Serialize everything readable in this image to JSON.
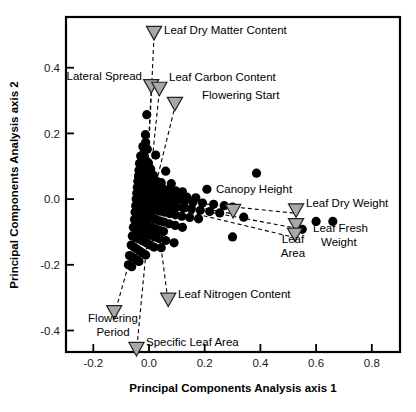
{
  "figure": {
    "kind": "pca-biplot",
    "background_color": "#ffffff",
    "foreground_color": "#000000",
    "marker_color": "#000000",
    "vector_marker_color": "#a8a8a8"
  },
  "axes": {
    "xlabel": "Principal Components Analysis axis 1",
    "ylabel": "Principal Components Analysis axis 2",
    "x_ticks": [
      "-0.2",
      "0.0",
      "0.2",
      "0.4",
      "0.6",
      "0.8"
    ],
    "y_ticks": [
      "0.4",
      "0.2",
      "0.0",
      "-0.2",
      "-0.4"
    ]
  },
  "chart_data": {
    "type": "scatter",
    "title": "",
    "xlabel": "Principal Components Analysis axis 1",
    "ylabel": "Principal Components Analysis axis 2",
    "xlim": [
      -0.29,
      0.9
    ],
    "ylim": [
      -0.5,
      0.61
    ],
    "xticks": [
      -0.2,
      0.0,
      0.2,
      0.4,
      0.6,
      0.8
    ],
    "yticks": [
      -0.4,
      -0.2,
      0.0,
      0.2,
      0.4
    ],
    "grid": false,
    "legend": "none",
    "series": [
      {
        "name": "species scores",
        "marker": "filled-circle",
        "color": "#000000",
        "points": [
          [
            -0.008,
            0.257
          ],
          [
            -0.013,
            0.196
          ],
          [
            -0.012,
            0.173
          ],
          [
            -0.022,
            0.16
          ],
          [
            -0.006,
            0.152
          ],
          [
            0.024,
            0.134
          ],
          [
            -0.018,
            0.142
          ],
          [
            -0.03,
            0.131
          ],
          [
            -0.026,
            0.12
          ],
          [
            -0.012,
            0.118
          ],
          [
            -0.002,
            0.11
          ],
          [
            -0.034,
            0.108
          ],
          [
            -0.02,
            0.1
          ],
          [
            -0.008,
            0.096
          ],
          [
            0.006,
            0.092
          ],
          [
            0.06,
            0.085
          ],
          [
            -0.036,
            0.088
          ],
          [
            -0.024,
            0.082
          ],
          [
            -0.01,
            0.079
          ],
          [
            0.002,
            0.075
          ],
          [
            0.016,
            0.072
          ],
          [
            0.386,
            0.079
          ],
          [
            -0.038,
            0.07
          ],
          [
            -0.028,
            0.066
          ],
          [
            -0.016,
            0.063
          ],
          [
            -0.004,
            0.06
          ],
          [
            0.01,
            0.058
          ],
          [
            0.026,
            0.055
          ],
          [
            0.044,
            0.05
          ],
          [
            0.08,
            0.047
          ],
          [
            -0.04,
            0.054
          ],
          [
            -0.03,
            0.05
          ],
          [
            -0.02,
            0.047
          ],
          [
            -0.01,
            0.044
          ],
          [
            0.0,
            0.041
          ],
          [
            0.012,
            0.039
          ],
          [
            0.024,
            0.036
          ],
          [
            0.038,
            0.033
          ],
          [
            0.054,
            0.03
          ],
          [
            0.072,
            0.028
          ],
          [
            0.096,
            0.025
          ],
          [
            0.12,
            0.022
          ],
          [
            -0.042,
            0.036
          ],
          [
            -0.032,
            0.033
          ],
          [
            -0.022,
            0.03
          ],
          [
            -0.012,
            0.028
          ],
          [
            -0.002,
            0.026
          ],
          [
            0.008,
            0.024
          ],
          [
            0.02,
            0.021
          ],
          [
            0.032,
            0.019
          ],
          [
            0.046,
            0.016
          ],
          [
            0.062,
            0.014
          ],
          [
            0.084,
            0.011
          ],
          [
            0.108,
            0.009
          ],
          [
            0.136,
            0.006
          ],
          [
            0.168,
            0.004
          ],
          [
            0.208,
            0.03
          ],
          [
            -0.044,
            0.018
          ],
          [
            -0.034,
            0.015
          ],
          [
            -0.024,
            0.013
          ],
          [
            -0.014,
            0.011
          ],
          [
            -0.004,
            0.009
          ],
          [
            0.006,
            0.007
          ],
          [
            0.018,
            0.005
          ],
          [
            0.03,
            0.003
          ],
          [
            0.044,
            0.001
          ],
          [
            0.06,
            -0.001
          ],
          [
            0.078,
            -0.003
          ],
          [
            0.1,
            -0.005
          ],
          [
            0.128,
            -0.007
          ],
          [
            0.158,
            -0.009
          ],
          [
            0.192,
            -0.012
          ],
          [
            0.232,
            -0.016
          ],
          [
            0.27,
            -0.02
          ],
          [
            0.3,
            -0.024
          ],
          [
            -0.046,
            0.0
          ],
          [
            -0.036,
            -0.002
          ],
          [
            -0.026,
            -0.004
          ],
          [
            -0.016,
            -0.006
          ],
          [
            -0.006,
            -0.008
          ],
          [
            0.004,
            -0.01
          ],
          [
            0.016,
            -0.012
          ],
          [
            0.028,
            -0.014
          ],
          [
            0.042,
            -0.016
          ],
          [
            0.058,
            -0.018
          ],
          [
            0.076,
            -0.021
          ],
          [
            0.098,
            -0.024
          ],
          [
            0.124,
            -0.027
          ],
          [
            0.152,
            -0.03
          ],
          [
            0.184,
            -0.034
          ],
          [
            0.218,
            -0.038
          ],
          [
            0.254,
            -0.042
          ],
          [
            0.34,
            -0.055
          ],
          [
            0.6,
            -0.068
          ],
          [
            0.66,
            -0.068
          ],
          [
            -0.048,
            -0.02
          ],
          [
            -0.038,
            -0.022
          ],
          [
            -0.028,
            -0.024
          ],
          [
            -0.018,
            -0.026
          ],
          [
            -0.008,
            -0.028
          ],
          [
            0.002,
            -0.03
          ],
          [
            0.014,
            -0.032
          ],
          [
            0.026,
            -0.034
          ],
          [
            0.04,
            -0.037
          ],
          [
            0.056,
            -0.04
          ],
          [
            0.074,
            -0.044
          ],
          [
            0.094,
            -0.048
          ],
          [
            0.118,
            -0.052
          ],
          [
            0.146,
            -0.056
          ],
          [
            0.178,
            -0.06
          ],
          [
            0.55,
            -0.092
          ],
          [
            -0.05,
            -0.04
          ],
          [
            -0.04,
            -0.043
          ],
          [
            -0.03,
            -0.046
          ],
          [
            -0.02,
            -0.049
          ],
          [
            -0.01,
            -0.052
          ],
          [
            0.0,
            -0.055
          ],
          [
            0.012,
            -0.058
          ],
          [
            0.024,
            -0.062
          ],
          [
            0.038,
            -0.066
          ],
          [
            0.054,
            -0.07
          ],
          [
            0.072,
            -0.075
          ],
          [
            0.094,
            -0.08
          ],
          [
            0.12,
            -0.086
          ],
          [
            0.3,
            -0.115
          ],
          [
            -0.052,
            -0.062
          ],
          [
            -0.042,
            -0.066
          ],
          [
            -0.032,
            -0.07
          ],
          [
            -0.022,
            -0.074
          ],
          [
            -0.012,
            -0.078
          ],
          [
            -0.002,
            -0.082
          ],
          [
            0.01,
            -0.086
          ],
          [
            0.022,
            -0.09
          ],
          [
            0.036,
            -0.094
          ],
          [
            0.052,
            -0.099
          ],
          [
            -0.056,
            -0.086
          ],
          [
            -0.046,
            -0.09
          ],
          [
            -0.036,
            -0.094
          ],
          [
            -0.026,
            -0.098
          ],
          [
            -0.016,
            -0.102
          ],
          [
            -0.006,
            -0.106
          ],
          [
            0.006,
            -0.11
          ],
          [
            0.02,
            -0.115
          ],
          [
            0.036,
            -0.12
          ],
          [
            0.06,
            -0.126
          ],
          [
            0.09,
            -0.133
          ],
          [
            -0.06,
            -0.112
          ],
          [
            -0.05,
            -0.116
          ],
          [
            -0.04,
            -0.12
          ],
          [
            -0.03,
            -0.124
          ],
          [
            -0.02,
            -0.128
          ],
          [
            -0.008,
            -0.134
          ],
          [
            0.004,
            -0.14
          ],
          [
            0.018,
            -0.146
          ],
          [
            0.044,
            -0.148
          ],
          [
            -0.064,
            -0.14
          ],
          [
            -0.054,
            -0.146
          ],
          [
            -0.044,
            -0.152
          ],
          [
            -0.034,
            -0.158
          ],
          [
            -0.024,
            -0.164
          ],
          [
            -0.012,
            -0.17
          ],
          [
            -0.07,
            -0.172
          ],
          [
            -0.058,
            -0.178
          ],
          [
            -0.046,
            -0.184
          ],
          [
            -0.036,
            -0.19
          ],
          [
            -0.074,
            -0.2
          ],
          [
            -0.062,
            -0.206
          ]
        ]
      }
    ],
    "vectors": [
      {
        "label": "Leaf Dry Matter Content",
        "x": 0.018,
        "y": 0.512,
        "tail_x": -0.005,
        "tail_y": 0.08
      },
      {
        "label": "Lateral Spread",
        "x": 0.008,
        "y": 0.35,
        "tail_x": -0.008,
        "tail_y": 0.06
      },
      {
        "label": "Leaf Carbon Content",
        "x": 0.037,
        "y": 0.342,
        "tail_x": 0.004,
        "tail_y": 0.06
      },
      {
        "label": "Flowering Start",
        "x": 0.093,
        "y": 0.296,
        "tail_x": 0.02,
        "tail_y": 0.03
      },
      {
        "label": "Canopy Height",
        "x": 0.302,
        "y": -0.03,
        "tail_x": -0.02,
        "tail_y": 0.006
      },
      {
        "label": "Leaf Dry Weight",
        "x": 0.528,
        "y": -0.028,
        "tail_x": -0.02,
        "tail_y": 0.004
      },
      {
        "label": "Leaf Fresh Weight",
        "x": 0.528,
        "y": -0.073,
        "tail_x": -0.022,
        "tail_y": -0.002
      },
      {
        "label": "Leaf Area",
        "x": 0.524,
        "y": -0.102,
        "tail_x": -0.024,
        "tail_y": -0.006
      },
      {
        "label": "Leaf Nitrogen Content",
        "x": 0.069,
        "y": -0.3,
        "tail_x": 0.03,
        "tail_y": -0.06
      },
      {
        "label": "Flowering Period",
        "x": -0.125,
        "y": -0.338,
        "tail_x": -0.06,
        "tail_y": -0.16
      },
      {
        "label": "Specific Leaf Area",
        "x": -0.045,
        "y": -0.45,
        "tail_x": -0.006,
        "tail_y": -0.12
      }
    ],
    "vector_labels": {
      "leaf_dry_matter_content": "Leaf Dry Matter Content",
      "lateral_spread": "Lateral Spread",
      "leaf_carbon_content": "Leaf Carbon Content",
      "flowering_start": "Flowering Start",
      "canopy_height": "Canopy Height",
      "leaf_dry_weight": "Leaf Dry Weight",
      "leaf_fresh_weight_line1": "Leaf Fresh",
      "leaf_fresh_weight_line2": "Weight",
      "leaf_area_line1": "Leaf",
      "leaf_area_line2": "Area",
      "leaf_nitrogen_content": "Leaf Nitrogen Content",
      "flowering_period_line1": "Flowering",
      "flowering_period_line2": "Period",
      "specific_leaf_area": "Specific Leaf Area"
    }
  }
}
